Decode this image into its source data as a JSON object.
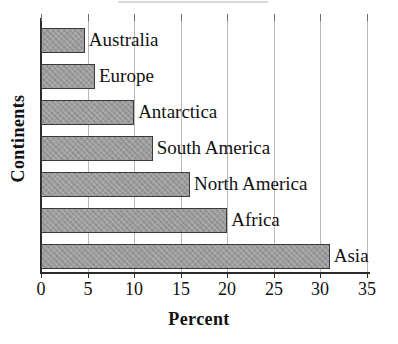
{
  "chart_data": {
    "type": "bar",
    "orientation": "horizontal",
    "title": "",
    "xlabel": "Percent",
    "ylabel": "Continents",
    "categories": [
      "Asia",
      "Africa",
      "North America",
      "South America",
      "Antarctica",
      "Europe",
      "Australia"
    ],
    "values": [
      31,
      20,
      16,
      12,
      10,
      5.8,
      4.7
    ],
    "xlim": [
      0,
      35
    ],
    "xticks": [
      0,
      5,
      10,
      15,
      20,
      25,
      30,
      35
    ],
    "xticklabels": [
      "0",
      "5",
      "10",
      "15",
      "20",
      "25",
      "30",
      "35"
    ],
    "grid": true,
    "grid_axis": "x",
    "legend": false,
    "bar_color": "#9b9b9b",
    "bar_edge_color": "#3a3a3a",
    "axis_color": "#2b2b2b",
    "gridline_color": "#b9b9b9",
    "bar_labels": [
      "Asia",
      "Africa",
      "North America",
      "South America",
      "Antarctica",
      "Europe",
      "Australia"
    ]
  }
}
